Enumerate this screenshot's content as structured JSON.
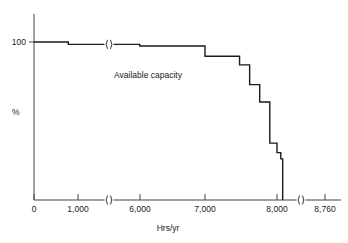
{
  "chart_data": {
    "type": "line",
    "title": "",
    "subtitle": "",
    "xlabel": "Hrs/yr",
    "ylabel": "%",
    "annotations": [
      {
        "text": "Available capacity",
        "x": 3500,
        "y": 78
      }
    ],
    "grid": false,
    "legend": null,
    "x_tick_labels": [
      "0",
      "1,000",
      "6,000",
      "7,000",
      "8,000",
      "8,760"
    ],
    "x_tick_values": [
      0,
      1000,
      6000,
      7000,
      8000,
      8760
    ],
    "y_tick_labels": [
      "100"
    ],
    "y_tick_values": [
      100
    ],
    "xlim": [
      0,
      8760
    ],
    "ylim": [
      0,
      105
    ],
    "axis_breaks": [
      {
        "axis": "x",
        "between": [
          1000,
          6000
        ],
        "symbol": ")("
      },
      {
        "axis": "x",
        "between": [
          8000,
          8760
        ],
        "symbol": ")("
      }
    ],
    "curve_breaks": [
      {
        "axis": "x",
        "between": [
          1000,
          6000
        ],
        "symbol": ")("
      }
    ],
    "series": [
      {
        "name": "Available capacity",
        "step": "post",
        "x": [
          0,
          780,
          780,
          5980,
          5980,
          7000,
          7000,
          7480,
          7480,
          7620,
          7620,
          7760,
          7760,
          7900,
          7900,
          8000,
          8000,
          8060,
          8060,
          8090,
          8090
        ],
        "y": [
          100,
          100,
          98.5,
          98.5,
          97.5,
          97.5,
          91,
          91,
          85.5,
          85.5,
          73,
          73,
          62,
          62,
          36,
          36,
          30,
          30,
          26,
          26,
          0
        ]
      }
    ]
  },
  "axis_break_symbol": ")(",
  "colors": {
    "curve": "#1a1a1a",
    "axis": "#444444",
    "background": "#ffffff"
  }
}
